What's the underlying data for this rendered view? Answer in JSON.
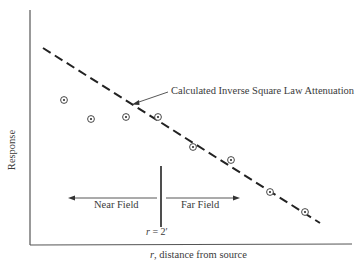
{
  "chart_data": {
    "type": "scatter",
    "title": "",
    "xlabel": "r, distance from source",
    "ylabel": "Response",
    "grid": false,
    "legend": null,
    "axis_ticks": {
      "x": [],
      "y": []
    },
    "series": [
      {
        "name": "Measured response",
        "marker": "circled-dot",
        "points_px": [
          [
            64,
            100
          ],
          [
            91,
            119
          ],
          [
            126,
            117
          ],
          [
            158,
            117
          ],
          [
            193,
            147
          ],
          [
            231,
            160
          ],
          [
            270,
            192
          ],
          [
            305,
            212
          ]
        ]
      },
      {
        "name": "Calculated Inverse Square Law Attenuation",
        "style": "dashed-line",
        "line_px": [
          [
            43,
            48
          ],
          [
            320,
            223
          ]
        ]
      }
    ],
    "annotations": [
      {
        "text": "Calculated Inverse Square Law Attenuation",
        "arrow_from_px": [
          168,
          92
        ],
        "arrow_to_px": [
          133,
          104
        ]
      },
      {
        "text": "Near Field",
        "arrow_direction": "left"
      },
      {
        "text": "Far Field",
        "arrow_direction": "right"
      },
      {
        "text": "r = 2′",
        "type": "vertical-boundary",
        "x_px": 161
      }
    ],
    "note": "Qualitative plot without numeric axis ticks; positions given in pixel coordinates."
  },
  "labels": {
    "ylabel": "Response",
    "xlabel": "r, distance from source",
    "annotation": "Calculated Inverse Square Law Attenuation",
    "near_field": "Near Field",
    "far_field": "Far Field",
    "boundary": "r = 2′"
  }
}
